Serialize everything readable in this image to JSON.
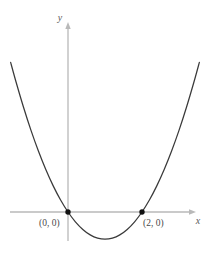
{
  "figure": {
    "background_color": "#ffffff",
    "width": 212,
    "height": 267
  },
  "axes": {
    "x_axis_label": "x",
    "y_axis_label": "y",
    "axis_color": "#b9b9b9",
    "x_axis_pixel_y": 212,
    "y_axis_pixel_x": 68,
    "x_axis_start_px": 10,
    "x_axis_end_px": 196,
    "y_axis_top_px": 22,
    "y_axis_bottom_px": 241,
    "x_arrow": "arrow-right",
    "y_arrow": "arrow-up"
  },
  "curve": {
    "color": "#3a3a3a",
    "stroke_width": 1.2,
    "description": "upward-opening parabola"
  },
  "points": [
    {
      "label": "(0, 0)",
      "x": 0,
      "y": 0,
      "pixel_x": 68,
      "pixel_y": 212,
      "label_pixel_x": 39,
      "label_pixel_y": 225,
      "marker_color": "#111111"
    },
    {
      "label": "(2, 0)",
      "x": 2,
      "y": 0,
      "pixel_x": 142,
      "pixel_y": 212,
      "label_pixel_x": 143,
      "label_pixel_y": 225,
      "marker_color": "#111111"
    }
  ],
  "chart_data": {
    "type": "line",
    "title": "",
    "subtitle": "",
    "xlabel": "x",
    "ylabel": "y",
    "grid": false,
    "legend": null,
    "xlim": [
      -1.6,
      3.5
    ],
    "ylim": [
      -1.2,
      6.6
    ],
    "curves": [
      {
        "name": "parabola",
        "equation": "y = x^2 - 2x",
        "roots": [
          0,
          2
        ],
        "vertex": [
          1,
          -1
        ],
        "opens": "up",
        "color": "#3a3a3a",
        "x": [
          -1.55,
          -1.4,
          -1.2,
          -1.0,
          -0.8,
          -0.6,
          -0.4,
          -0.2,
          0.0,
          0.2,
          0.4,
          0.6,
          0.8,
          1.0,
          1.2,
          1.4,
          1.6,
          1.8,
          2.0,
          2.2,
          2.4,
          2.6,
          2.8,
          3.0,
          3.2,
          3.4,
          3.55
        ],
        "y": [
          5.5,
          4.76,
          3.84,
          3.0,
          2.24,
          1.56,
          0.96,
          0.44,
          0.0,
          -0.36,
          -0.64,
          -0.84,
          -0.96,
          -1.0,
          -0.96,
          -0.84,
          -0.64,
          -0.36,
          0.0,
          0.44,
          0.96,
          1.56,
          2.24,
          3.0,
          3.84,
          4.76,
          5.5
        ]
      }
    ],
    "annotations": [
      {
        "text": "(0, 0)",
        "x": 0,
        "y": 0
      },
      {
        "text": "(2, 0)",
        "x": 2,
        "y": 0
      }
    ],
    "markers": [
      {
        "x": 0,
        "y": 0
      },
      {
        "x": 2,
        "y": 0
      }
    ]
  }
}
